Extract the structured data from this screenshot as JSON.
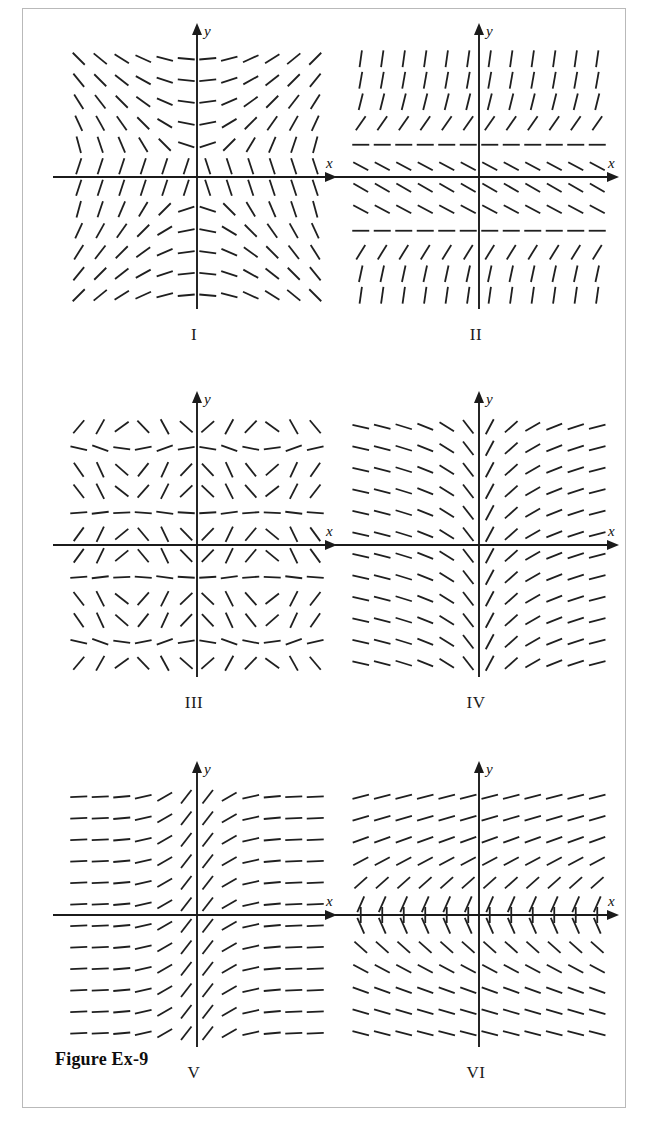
{
  "figure": {
    "caption": "Figure Ex-9",
    "border_color": "#b9b9b9",
    "ink_color": "#1f1f1f",
    "background": "#ffffff"
  },
  "axis_labels": {
    "x": "x",
    "y": "y"
  },
  "panels": [
    {
      "id": "I",
      "label": "I",
      "row": 0,
      "col": 0
    },
    {
      "id": "II",
      "label": "II",
      "row": 0,
      "col": 1
    },
    {
      "id": "III",
      "label": "III",
      "row": 1,
      "col": 0
    },
    {
      "id": "IV",
      "label": "IV",
      "row": 1,
      "col": 1
    },
    {
      "id": "V",
      "label": "V",
      "row": 2,
      "col": 0
    },
    {
      "id": "VI",
      "label": "VI",
      "row": 2,
      "col": 1
    }
  ],
  "chart_data": [
    {
      "type": "scatter",
      "title": "I",
      "subtitle": "Slope field I",
      "xlabel": "x",
      "ylabel": "y",
      "xlim": [
        -6.5,
        6.5
      ],
      "ylim": [
        -6.5,
        6.5
      ],
      "grid": false,
      "legend": "none",
      "plot_kind": "slope-field",
      "formula": "dy/dx = x/y",
      "description": "Hyperbolic slope field; segments steep (near vertical) close to the y-axis on the right and near the x-axis, flattening to horizontal far from the y-axis. Saddle-like symmetry across both axes.",
      "x": [
        -5.5,
        -4.5,
        -3.5,
        -2.5,
        -1.5,
        -0.5,
        0.5,
        1.5,
        2.5,
        3.5,
        4.5,
        5.5
      ],
      "y": [
        5.5,
        4.5,
        3.5,
        2.5,
        1.5,
        0.5,
        -0.5,
        -1.5,
        -2.5,
        -3.5,
        -4.5,
        -5.5
      ],
      "slopes_note": "slope(x,y) = x / y, clamped for display"
    },
    {
      "type": "scatter",
      "title": "II",
      "subtitle": "Slope field II",
      "xlabel": "x",
      "ylabel": "y",
      "xlim": [
        -6.5,
        6.5
      ],
      "ylim": [
        -6.5,
        6.5
      ],
      "grid": false,
      "legend": "none",
      "plot_kind": "slope-field",
      "formula": "dy/dx = f(y)  (depends only on y)",
      "description": "Every horizontal row of segments has one common slope. Horizontal (zero-slope) equilibrium rows occur at about y = +2 and y = -2; segments are near-vertical far above and far below, and tilt down-right in the band between the equilibria.",
      "x": [
        -5.5,
        -4.5,
        -3.5,
        -2.5,
        -1.5,
        -0.5,
        0.5,
        1.5,
        2.5,
        3.5,
        4.5,
        5.5
      ],
      "y": [
        5.5,
        4.5,
        3.5,
        2.5,
        1.5,
        0.5,
        -0.5,
        -1.5,
        -2.5,
        -3.5,
        -4.5,
        -5.5
      ],
      "row_slopes_deg": [
        82,
        80,
        76,
        55,
        0,
        -28,
        -30,
        -28,
        0,
        58,
        78,
        82
      ],
      "equilibrium_rows_y": [
        2,
        -2
      ]
    },
    {
      "type": "scatter",
      "title": "III",
      "subtitle": "Slope field III",
      "xlabel": "x",
      "ylabel": "y",
      "xlim": [
        -6.5,
        6.5
      ],
      "ylim": [
        -6.5,
        6.5
      ],
      "grid": false,
      "legend": "none",
      "plot_kind": "slope-field",
      "formula": "dy/dx = sin(x)·sin(y)  (periodic in x and y)",
      "description": "Doubly periodic pattern: segments repeat every 6 columns horizontally and every 6 rows vertically. Rows of nearly horizontal segments separate bands where slopes swing from down-right to up-right.",
      "x": [
        -5.5,
        -4.5,
        -3.5,
        -2.5,
        -1.5,
        -0.5,
        0.5,
        1.5,
        2.5,
        3.5,
        4.5,
        5.5
      ],
      "y": [
        5.5,
        4.5,
        3.5,
        2.5,
        1.5,
        0.5,
        -0.5,
        -1.5,
        -2.5,
        -3.5,
        -4.5,
        -5.5
      ]
    },
    {
      "type": "scatter",
      "title": "IV",
      "subtitle": "Slope field IV",
      "xlabel": "x",
      "ylabel": "y",
      "xlim": [
        -6.5,
        6.5
      ],
      "ylim": [
        -6.5,
        6.5
      ],
      "grid": false,
      "legend": "none",
      "plot_kind": "slope-field",
      "formula": "dy/dx = 1/x  (depends only on x)",
      "description": "Slope depends only on x: steeply positive just right of the y-axis, decaying toward horizontal as x grows; on the left of the axis slopes are shallow negative, steepening toward the axis. Identical in every row.",
      "x": [
        -5.5,
        -4.5,
        -3.5,
        -2.5,
        -1.5,
        -0.5,
        0.5,
        1.5,
        2.5,
        3.5,
        4.5,
        5.5
      ],
      "y": [
        5.5,
        4.5,
        3.5,
        2.5,
        1.5,
        0.5,
        -0.5,
        -1.5,
        -2.5,
        -3.5,
        -4.5,
        -5.5
      ],
      "column_slopes_deg": [
        -12,
        -14,
        -17,
        -22,
        -32,
        -52,
        62,
        42,
        30,
        22,
        18,
        14
      ]
    },
    {
      "type": "scatter",
      "title": "V",
      "subtitle": "Slope field V",
      "xlabel": "x",
      "ylabel": "y",
      "xlim": [
        -6.5,
        6.5
      ],
      "ylim": [
        -6.5,
        6.5
      ],
      "grid": false,
      "legend": "none",
      "plot_kind": "slope-field",
      "formula": "dy/dx = e^(-x^2)  (depends only on x)",
      "description": "Bell-shaped dependence on x: segments are horizontal for |x| large and tilt up steeply only in a narrow band near x = 0. Every row is identical.",
      "x": [
        -5.5,
        -4.5,
        -3.5,
        -2.5,
        -1.5,
        -0.5,
        0.5,
        1.5,
        2.5,
        3.5,
        4.5,
        5.5
      ],
      "y": [
        5.5,
        4.5,
        3.5,
        2.5,
        1.5,
        0.5,
        -0.5,
        -1.5,
        -2.5,
        -3.5,
        -4.5,
        -5.5
      ],
      "column_slopes_deg": [
        2,
        3,
        5,
        12,
        30,
        52,
        52,
        30,
        12,
        5,
        3,
        2
      ]
    },
    {
      "type": "scatter",
      "title": "VI",
      "subtitle": "Slope field VI",
      "xlabel": "x",
      "ylabel": "y",
      "xlim": [
        -6.5,
        6.5
      ],
      "ylim": [
        -6.5,
        6.5
      ],
      "grid": false,
      "legend": "none",
      "plot_kind": "slope-field",
      "formula": "dy/dx = 1/y  (depends only on y)",
      "description": "Slope depends only on y: vertical segments sitting on the x-axis (y = 0), steep positive just above it flattening upward, steep negative just below it flattening downward. Identical in every column.",
      "x": [
        -5.5,
        -4.5,
        -3.5,
        -2.5,
        -1.5,
        -0.5,
        0.5,
        1.5,
        2.5,
        3.5,
        4.5,
        5.5
      ],
      "y": [
        5.5,
        4.5,
        3.5,
        2.5,
        1.5,
        0.5,
        -0.5,
        -1.5,
        -2.5,
        -3.5,
        -4.5,
        -5.5
      ],
      "row_slopes_deg": [
        14,
        16,
        20,
        28,
        42,
        66,
        -66,
        -42,
        -28,
        -20,
        -16,
        -14
      ],
      "axis_row_vertical": true
    }
  ]
}
